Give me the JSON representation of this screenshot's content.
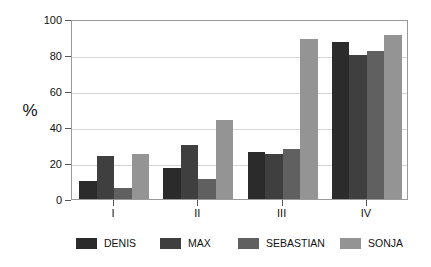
{
  "chart_data": {
    "type": "bar",
    "title": "",
    "subtitle": "",
    "xlabel": "",
    "ylabel": "%",
    "categories": [
      "I",
      "II",
      "III",
      "IV"
    ],
    "series": [
      {
        "name": "DENIS",
        "color": "#2b2b2b",
        "values": [
          10,
          17,
          26,
          87
        ]
      },
      {
        "name": "MAX",
        "color": "#3f3f3f",
        "values": [
          24,
          30,
          25,
          80
        ]
      },
      {
        "name": "SEBASTIAN",
        "color": "#606060",
        "values": [
          6,
          11,
          28,
          82
        ]
      },
      {
        "name": "SONJA",
        "color": "#949494",
        "values": [
          25,
          44,
          89,
          91
        ]
      }
    ],
    "ylim": [
      0,
      100
    ],
    "yticks": [
      0,
      20,
      40,
      60,
      80,
      100
    ],
    "ytick_labels": [
      "0",
      "20",
      "40",
      "60",
      "80",
      "100"
    ],
    "grid": true,
    "grid_axis": "y",
    "legend_position": "bottom",
    "frame": true
  },
  "legend": {
    "entries": [
      {
        "label": "DENIS"
      },
      {
        "label": "MAX"
      },
      {
        "label": "SEBASTIAN"
      },
      {
        "label": "SONJA"
      }
    ]
  },
  "axis": {
    "y_title": "%"
  }
}
